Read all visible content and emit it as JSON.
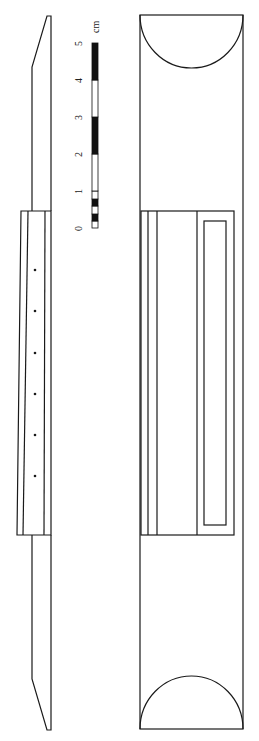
{
  "figure": {
    "type": "technical-drawing",
    "views": [
      "side-view",
      "front-view"
    ]
  },
  "scale_bar": {
    "unit_label": "cm",
    "tick_labels": [
      "0",
      "1",
      "2",
      "3",
      "4",
      "5"
    ],
    "segments": [
      {
        "from": 0,
        "to": 0.2,
        "color": "white"
      },
      {
        "from": 0.2,
        "to": 0.4,
        "color": "black"
      },
      {
        "from": 0.4,
        "to": 0.6,
        "color": "white"
      },
      {
        "from": 0.6,
        "to": 0.8,
        "color": "black"
      },
      {
        "from": 0.8,
        "to": 1.0,
        "color": "white"
      },
      {
        "from": 1.0,
        "to": 2.0,
        "color": "white"
      },
      {
        "from": 2.0,
        "to": 3.0,
        "color": "black"
      },
      {
        "from": 3.0,
        "to": 4.0,
        "color": "white"
      },
      {
        "from": 4.0,
        "to": 5.0,
        "color": "black"
      }
    ],
    "colors": {
      "black": "#111111",
      "white": "#ffffff"
    }
  },
  "side_view": {
    "hole_count": 6
  },
  "front_view": {
    "end_shape": "semicircle"
  }
}
